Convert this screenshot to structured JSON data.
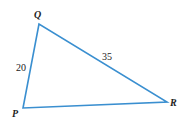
{
  "diagram": {
    "type": "triangle",
    "stroke_color": "#3a8fd0",
    "vertices": [
      {
        "name": "Q",
        "x": 39,
        "y": 24,
        "label_x": 34,
        "label_y": 18
      },
      {
        "name": "P",
        "x": 23,
        "y": 108,
        "label_x": 12,
        "label_y": 117
      },
      {
        "name": "R",
        "x": 167,
        "y": 102,
        "label_x": 170,
        "label_y": 106
      }
    ],
    "sides": [
      {
        "name": "PQ",
        "label": "20",
        "label_x": 16,
        "label_y": 71
      },
      {
        "name": "QR",
        "label": "35",
        "label_x": 102,
        "label_y": 60
      },
      {
        "name": "PR",
        "label": ""
      }
    ]
  }
}
